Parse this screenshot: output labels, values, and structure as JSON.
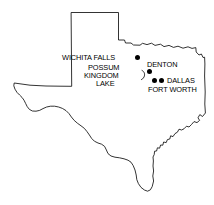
{
  "map": {
    "title": "Texas",
    "outline_color": "#000000",
    "background_color": "#ffffff",
    "marker_color": "#000000",
    "width": 214,
    "height": 205,
    "labels": [
      {
        "id": "wichita-falls",
        "text": "WICHITA FALLS",
        "x": 62,
        "y": 54
      },
      {
        "id": "possum",
        "text": "POSSUM",
        "x": 88,
        "y": 64
      },
      {
        "id": "kingdom",
        "text": "KINGDOM",
        "x": 84,
        "y": 72
      },
      {
        "id": "lake",
        "text": "LAKE",
        "x": 96,
        "y": 80
      },
      {
        "id": "denton",
        "text": "DENTON",
        "x": 147,
        "y": 61
      },
      {
        "id": "dallas",
        "text": "DALLAS",
        "x": 167,
        "y": 77
      },
      {
        "id": "fort-worth",
        "text": "FORT WORTH",
        "x": 148,
        "y": 86
      }
    ],
    "city_markers": [
      {
        "id": "wichita-falls-marker",
        "name": "Wichita Falls",
        "x": 135,
        "y": 55
      },
      {
        "id": "denton-marker",
        "name": "Denton",
        "x": 147,
        "y": 69
      },
      {
        "id": "fort-worth-marker",
        "name": "Fort Worth",
        "x": 152,
        "y": 78
      },
      {
        "id": "dallas-marker",
        "name": "Dallas",
        "x": 159,
        "y": 78
      }
    ],
    "features": [
      {
        "id": "possum-kingdom-lake-shape",
        "name": "Possum Kingdom Lake"
      }
    ]
  }
}
